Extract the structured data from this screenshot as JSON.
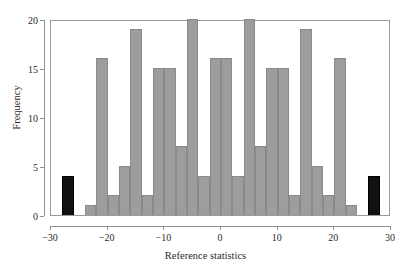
{
  "chart_data": {
    "type": "bar",
    "title": "",
    "subtitle": "",
    "xlabel": "Reference statistics",
    "ylabel": "Frequency",
    "xlim": [
      -30,
      30
    ],
    "ylim": [
      0,
      20
    ],
    "xticks": [
      -30,
      -20,
      -10,
      0,
      10,
      20,
      30
    ],
    "xtick_labels": [
      "−30",
      "−20",
      "−10",
      "0",
      "10",
      "20",
      "30"
    ],
    "yticks": [
      0,
      5,
      10,
      15,
      20
    ],
    "ytick_labels": [
      "0",
      "5",
      "10",
      "15",
      "20"
    ],
    "grid": false,
    "legend": null,
    "bin_width": 2,
    "colors": {
      "bar_fill": "#9d9d9d",
      "bar_edge": "#8a8a8a",
      "highlight_fill": "#111111",
      "highlight_edge": "#000000",
      "axis": "#8f8f8f",
      "text": "#2b2b2b",
      "background": "#ffffff"
    },
    "bins": [
      {
        "x_left": -28,
        "x_right": -26,
        "value": 4,
        "color": "black"
      },
      {
        "x_left": -24,
        "x_right": -22,
        "value": 1,
        "color": "gray"
      },
      {
        "x_left": -22,
        "x_right": -20,
        "value": 16,
        "color": "gray"
      },
      {
        "x_left": -20,
        "x_right": -18,
        "value": 2,
        "color": "gray"
      },
      {
        "x_left": -18,
        "x_right": -16,
        "value": 5,
        "color": "gray"
      },
      {
        "x_left": -16,
        "x_right": -14,
        "value": 19,
        "color": "gray"
      },
      {
        "x_left": -14,
        "x_right": -12,
        "value": 2,
        "color": "gray"
      },
      {
        "x_left": -12,
        "x_right": -10,
        "value": 15,
        "color": "gray"
      },
      {
        "x_left": -10,
        "x_right": -8,
        "value": 15,
        "color": "gray"
      },
      {
        "x_left": -8,
        "x_right": -6,
        "value": 7,
        "color": "gray"
      },
      {
        "x_left": -6,
        "x_right": -4,
        "value": 20,
        "color": "gray"
      },
      {
        "x_left": -4,
        "x_right": -2,
        "value": 4,
        "color": "gray"
      },
      {
        "x_left": -2,
        "x_right": 0,
        "value": 16,
        "color": "gray"
      },
      {
        "x_left": 0,
        "x_right": 2,
        "value": 16,
        "color": "gray"
      },
      {
        "x_left": 2,
        "x_right": 4,
        "value": 4,
        "color": "gray"
      },
      {
        "x_left": 4,
        "x_right": 6,
        "value": 20,
        "color": "gray"
      },
      {
        "x_left": 6,
        "x_right": 8,
        "value": 7,
        "color": "gray"
      },
      {
        "x_left": 8,
        "x_right": 10,
        "value": 15,
        "color": "gray"
      },
      {
        "x_left": 10,
        "x_right": 12,
        "value": 15,
        "color": "gray"
      },
      {
        "x_left": 12,
        "x_right": 14,
        "value": 2,
        "color": "gray"
      },
      {
        "x_left": 14,
        "x_right": 16,
        "value": 19,
        "color": "gray"
      },
      {
        "x_left": 16,
        "x_right": 18,
        "value": 5,
        "color": "gray"
      },
      {
        "x_left": 18,
        "x_right": 20,
        "value": 2,
        "color": "gray"
      },
      {
        "x_left": 20,
        "x_right": 22,
        "value": 16,
        "color": "gray"
      },
      {
        "x_left": 22,
        "x_right": 24,
        "value": 1,
        "color": "gray"
      },
      {
        "x_left": 26,
        "x_right": 28,
        "value": 4,
        "color": "black"
      }
    ]
  }
}
